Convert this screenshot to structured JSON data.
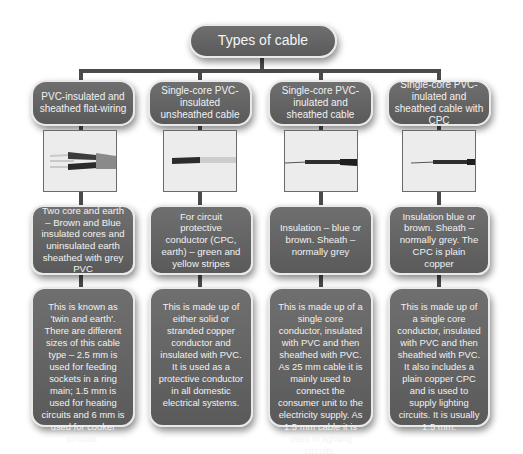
{
  "title": "Types of cable",
  "colors": {
    "box_fill": "#656565",
    "box_border": "#e9e9e9",
    "connector": "#4a4a4a",
    "text": "#f2f2f2",
    "background": "#ffffff"
  },
  "columns": [
    {
      "heading": "PVC-insulated and sheathed flat-wiring",
      "image": "flat-twin-and-earth-cable-photo",
      "description": "Two core and earth – Brown and Blue insulated cores and uninsulated earth sheathed with grey PVC",
      "details": "This is known as 'twin and earth'. There are different sizes of this cable type – 2.5 mm is used for feeding sockets in a ring main; 1.5 mm is used for heating circuits and 6 mm is used for cooker circuits."
    },
    {
      "heading": "Single-core PVC-insulated unsheathed cable",
      "image": "single-core-unsheathed-cable-photo",
      "description": "For circuit protective conductor (CPC, earth) – green and yellow stripes",
      "details": "This is made up of either solid or stranded copper conductor and insulated with PVC. It is used as a protective conductor in all domestic electrical systems."
    },
    {
      "heading": "Single-core PVC-inulated and sheathed cable",
      "image": "single-core-sheathed-cable-photo",
      "description": "Insulation – blue or brown. Sheath – normally grey",
      "details": "This is made up of a single core conductor, insulated with PVC and then sheathed with PVC. As 25 mm cable it is mainly used to connect the consumer unit to the electricity supply. As 1.5 mm cable it is used in lighting circuits."
    },
    {
      "heading": "Single-core PVC-inulated and sheathed cable with CPC",
      "image": "single-core-sheathed-cable-with-cpc-photo",
      "description": "Insulation blue or brown. Sheath – normally grey. The CPC is plain copper",
      "details": "This is made up of a single core conductor, insulated with PVC and then sheathed with PVC. It also includes a plain copper CPC and is used to supply lighting circuits. It is usually 1.5 mm."
    }
  ]
}
